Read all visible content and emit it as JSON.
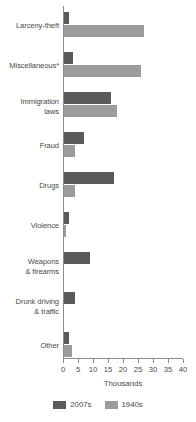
{
  "chart_data": {
    "type": "bar",
    "orientation": "horizontal",
    "title": "",
    "subtitle": "",
    "xlabel": "Thousands",
    "ylabel": "",
    "xlim": [
      0,
      40
    ],
    "xticks": [
      0,
      5,
      10,
      15,
      20,
      25,
      30,
      35,
      40
    ],
    "xtick_labels": [
      "0",
      "5",
      "10",
      "15",
      "20",
      "25",
      "30",
      "35",
      "40"
    ],
    "grid": false,
    "legend_position": "bottom",
    "categories": [
      "Larceny-theft",
      "Miscellaneous*",
      "Immigration\nlaws",
      "Fraud",
      "Drugs",
      "Violence",
      "Weapons\n& firearms",
      "Drunk driving\n& traffic",
      "Other"
    ],
    "series": [
      {
        "name": "2007s",
        "color": "#5a5a5a",
        "values": [
          2.0,
          3.2,
          16.0,
          7.0,
          17.0,
          2.0,
          9.0,
          4.0,
          2.0
        ]
      },
      {
        "name": "1940s",
        "color": "#9c9c9c",
        "values": [
          27.0,
          26.0,
          18.0,
          4.0,
          4.0,
          1.0,
          0.0,
          0.0,
          3.0
        ]
      }
    ]
  },
  "legend": {
    "items": [
      {
        "label": "2007s",
        "color": "#5a5a5a"
      },
      {
        "label": "1940s",
        "color": "#9c9c9c"
      }
    ]
  }
}
